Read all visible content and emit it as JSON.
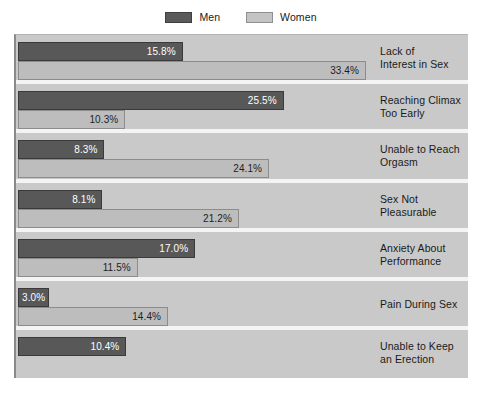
{
  "legend": {
    "position": "top-center",
    "entries": [
      {
        "label": "Men",
        "color": "#585858",
        "swatch_icon": "legend-swatch-men"
      },
      {
        "label": "Women",
        "color": "#bdbdbd",
        "swatch_icon": "legend-swatch-women"
      }
    ]
  },
  "colors": {
    "men": "#585858",
    "women": "#bdbdbd",
    "plot_background": "#c9c9c9",
    "separator": "#f4f4f4",
    "page_background": "#ffffff",
    "text": "#1a1a1a"
  },
  "chart_data": {
    "type": "bar",
    "orientation": "horizontal",
    "title": "",
    "subtitle": "",
    "xlabel": "",
    "ylabel": "",
    "xlim": [
      0,
      43
    ],
    "grid": false,
    "legend_position": "top-center",
    "value_suffix": "%",
    "categories": [
      "Lack of Interest in Sex",
      "Reaching Climax Too Early",
      "Unable to Reach Orgasm",
      "Sex Not Pleasurable",
      "Anxiety About Performance",
      "Pain During Sex",
      "Unable to Keep an Erection"
    ],
    "series": [
      {
        "name": "Men",
        "color": "#585858",
        "values": [
          15.8,
          25.5,
          8.3,
          8.1,
          17.0,
          3.0,
          10.4
        ],
        "labels": [
          "15.8%",
          "25.5%",
          "8.3%",
          "8.1%",
          "17.0%",
          "3.0%",
          "10.4%"
        ]
      },
      {
        "name": "Women",
        "color": "#bdbdbd",
        "values": [
          33.4,
          10.3,
          24.1,
          21.2,
          11.5,
          14.4,
          null
        ],
        "labels": [
          "33.4%",
          "10.3%",
          "24.1%",
          "21.2%",
          "11.5%",
          "14.4%",
          null
        ]
      }
    ]
  },
  "groups": [
    {
      "label_lines": [
        "Lack of",
        "Interest in Sex"
      ],
      "men": {
        "value": 15.8,
        "label": "15.8%"
      },
      "women": {
        "value": 33.4,
        "label": "33.4%"
      }
    },
    {
      "label_lines": [
        "Reaching Climax",
        "Too Early"
      ],
      "men": {
        "value": 25.5,
        "label": "25.5%"
      },
      "women": {
        "value": 10.3,
        "label": "10.3%"
      }
    },
    {
      "label_lines": [
        "Unable to Reach",
        "Orgasm"
      ],
      "men": {
        "value": 8.3,
        "label": "8.3%"
      },
      "women": {
        "value": 24.1,
        "label": "24.1%"
      }
    },
    {
      "label_lines": [
        "Sex Not",
        "Pleasurable"
      ],
      "men": {
        "value": 8.1,
        "label": "8.1%"
      },
      "women": {
        "value": 21.2,
        "label": "21.2%"
      }
    },
    {
      "label_lines": [
        "Anxiety About",
        "Performance"
      ],
      "men": {
        "value": 17.0,
        "label": "17.0%"
      },
      "women": {
        "value": 11.5,
        "label": "11.5%"
      }
    },
    {
      "label_lines": [
        "Pain During Sex"
      ],
      "men": {
        "value": 3.0,
        "label": "3.0%"
      },
      "women": {
        "value": 14.4,
        "label": "14.4%"
      }
    },
    {
      "label_lines": [
        "Unable to Keep",
        "an Erection"
      ],
      "men": {
        "value": 10.4,
        "label": "10.4%"
      },
      "women": null
    }
  ]
}
